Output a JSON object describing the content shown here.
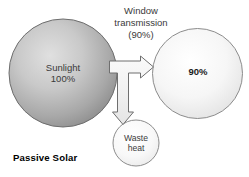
{
  "diagram": {
    "caption": "Passive Solar",
    "nodes": {
      "source": {
        "name": "sunlight",
        "line1": "Sunlight",
        "line2": "100%",
        "value_percent": 100,
        "fill_light": "#d8d8d8",
        "fill_dark": "#9a9a9a",
        "stroke": "#6b6b6b"
      },
      "output": {
        "name": "transmitted-light",
        "line1": "90%",
        "value_percent": 90,
        "fill_light": "#fdfdfd",
        "fill_dark": "#e2e2e2",
        "stroke": "#8a8a8a"
      },
      "waste": {
        "name": "waste-heat",
        "line1": "Waste",
        "line2": "heat",
        "fill_light": "#fbfbfb",
        "fill_dark": "#ececec",
        "stroke": "#8a8a8a"
      }
    },
    "connector": {
      "name": "window-transmission-arrow",
      "label_line1": "Window",
      "label_line2": "transmission",
      "label_line3": "(90%)",
      "fill": "#f2f2f2",
      "stroke": "#6f6f6f"
    },
    "colors": {
      "background": "#ffffff",
      "text": "#2b2b2b",
      "caption": "#000000"
    }
  }
}
